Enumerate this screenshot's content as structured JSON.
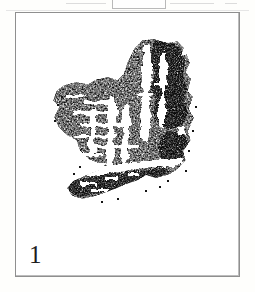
{
  "page": {
    "background_color": "#fdfdfb",
    "width": 255,
    "height": 292
  },
  "top_fragment": {
    "name": "cropped-figure-fragment",
    "description": "faint partially cropped box outline and rule lines from the figure above",
    "box_color": "#b9b9b9",
    "rule_color": "#dcdcdc"
  },
  "plate": {
    "border_color": "#8f8f8f",
    "background_color": "#ffffff",
    "caption": "1"
  },
  "artwork": {
    "name": "ink-rubbing-impression",
    "description": "high-contrast black and white rubbing of an archaic seal inscription",
    "ink_color": "#0b0b0b",
    "paper_color": "#ffffff"
  }
}
